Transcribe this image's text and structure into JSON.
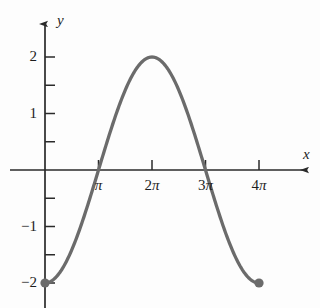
{
  "figure": {
    "background_color": "#fdfdfd",
    "curve_color": "#6b6b6b",
    "axis_color": "#2a2a2a",
    "text_color": "#1d1d1d"
  },
  "axes": {
    "y_axis_label": "y",
    "x_axis_label": "x"
  },
  "x_ticks": [
    {
      "label": "π",
      "value": 3.1416
    },
    {
      "label": "2π",
      "value": 6.2832
    },
    {
      "label": "3π",
      "value": 9.4248
    },
    {
      "label": "4π",
      "value": 12.5664
    }
  ],
  "y_ticks": [
    {
      "label": "2",
      "value": 2
    },
    {
      "label": "1",
      "value": 1
    },
    {
      "label": "−1",
      "value": -1
    },
    {
      "label": "−2",
      "value": -2
    }
  ],
  "y_minor_ticks": [
    2,
    1.5,
    1,
    0.5,
    -0.5,
    -1,
    -1.5,
    -2
  ],
  "endpoints": [
    {
      "x": 0,
      "y": -2
    },
    {
      "x": 12.5664,
      "y": -2
    }
  ],
  "chart_data": {
    "type": "line",
    "title": "",
    "subtitle": "",
    "xlabel": "x",
    "ylabel": "y",
    "xlim": [
      -0.45,
      14.2
    ],
    "ylim": [
      -2.6,
      2.65
    ],
    "grid": false,
    "legend": false,
    "equation": "y = -2 cos(x/2)",
    "x_tick_labels": [
      "π",
      "2π",
      "3π",
      "4π"
    ],
    "x_tick_values": [
      3.1416,
      6.2832,
      9.4248,
      12.5664
    ],
    "y_tick_labels": [
      "2",
      "1",
      "−1",
      "−2"
    ],
    "y_tick_values": [
      2,
      1,
      -1,
      -2
    ],
    "y_minor_tick_values": [
      2,
      1.5,
      1,
      0.5,
      -0.5,
      -1,
      -1.5,
      -2
    ],
    "series": [
      {
        "name": "y = -2cos(x/2)",
        "color": "#6b6b6b",
        "x": [
          0.0,
          0.3927,
          0.7854,
          1.1781,
          1.5708,
          1.9635,
          2.3562,
          2.7489,
          3.1416,
          3.5343,
          3.927,
          4.3197,
          4.7124,
          5.1051,
          5.4978,
          5.8905,
          6.2832,
          6.6759,
          7.0686,
          7.4613,
          7.854,
          8.2467,
          8.6394,
          9.0321,
          9.4248,
          9.8175,
          10.2102,
          10.6029,
          10.9956,
          11.3883,
          11.781,
          12.1737,
          12.5664
        ],
        "y": [
          -2.0,
          -1.9616,
          -1.8478,
          -1.6629,
          -1.4142,
          -1.1111,
          -0.7654,
          -0.3902,
          0.0,
          0.3902,
          0.7654,
          1.1111,
          1.4142,
          1.6629,
          1.8478,
          1.9616,
          2.0,
          1.9616,
          1.8478,
          1.6629,
          1.4142,
          1.1111,
          0.7654,
          0.3902,
          0.0,
          -0.3902,
          -0.7654,
          -1.1111,
          -1.4142,
          -1.6629,
          -1.8478,
          -1.9616,
          -2.0
        ]
      }
    ],
    "markers": [
      {
        "x": 0,
        "y": -2,
        "style": "filled-circle",
        "color": "#6b6b6b"
      },
      {
        "x": 12.5664,
        "y": -2,
        "style": "filled-circle",
        "color": "#6b6b6b"
      }
    ],
    "zero_crossings": [
      3.1416,
      9.4248
    ],
    "maximum": {
      "x": 6.2832,
      "y": 2
    },
    "minima": [
      {
        "x": 0,
        "y": -2
      },
      {
        "x": 12.5664,
        "y": -2
      }
    ],
    "amplitude": 2,
    "period": 12.5664
  }
}
